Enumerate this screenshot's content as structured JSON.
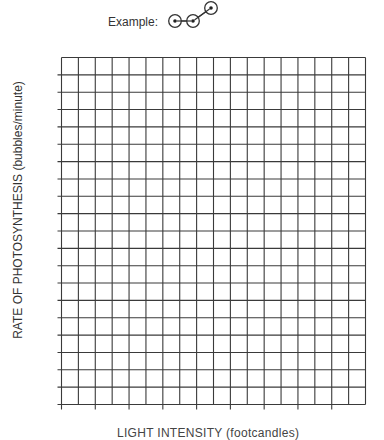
{
  "example": {
    "label": "Example:",
    "points": [
      [
        0,
        0
      ],
      [
        1,
        0
      ],
      [
        2,
        1
      ]
    ]
  },
  "chart_data": {
    "type": "line",
    "title": "",
    "xlabel": "LIGHT INTENSITY (footcandles)",
    "ylabel": "RATE OF PHOTOSYNTHESIS (bubbles/minute)",
    "grid": true,
    "columns": 18,
    "rows": 20,
    "x_major_tick_every": 2,
    "y_major_tick_every": 1,
    "series": [],
    "x_tick_labels": [],
    "y_tick_labels": []
  }
}
